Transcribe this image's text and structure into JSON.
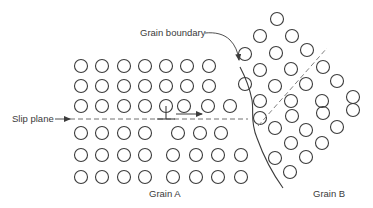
{
  "figure": {
    "type": "crystal-lattice-diagram",
    "labels": {
      "grain_boundary": "Grain boundary",
      "slip_plane": "Slip plane",
      "grain_a": "Grain A",
      "grain_b": "Grain B"
    },
    "colors": {
      "stroke": "#3c3c3c",
      "dashed_line": "#707070",
      "text": "#3a3a3a",
      "background": "#ffffff"
    },
    "atom_radius": 6.5,
    "grain_a": {
      "atoms": [
        [
          81,
          66
        ],
        [
          102,
          66
        ],
        [
          124,
          66
        ],
        [
          145,
          66
        ],
        [
          166,
          66
        ],
        [
          187,
          66
        ],
        [
          209,
          66
        ],
        [
          81,
          86
        ],
        [
          102,
          86
        ],
        [
          124,
          86
        ],
        [
          145,
          86
        ],
        [
          166,
          86
        ],
        [
          187,
          86
        ],
        [
          209,
          86
        ],
        [
          81,
          106
        ],
        [
          102,
          106
        ],
        [
          124,
          106
        ],
        [
          145,
          106
        ],
        [
          166,
          106
        ],
        [
          184,
          106
        ],
        [
          208,
          106
        ],
        [
          230,
          106
        ],
        [
          81,
          133
        ],
        [
          102,
          133
        ],
        [
          124,
          133
        ],
        [
          145,
          133
        ],
        [
          178,
          133
        ],
        [
          200,
          133
        ],
        [
          221,
          133
        ],
        [
          81,
          155
        ],
        [
          102,
          155
        ],
        [
          124,
          155
        ],
        [
          145,
          155
        ],
        [
          173,
          155
        ],
        [
          196,
          155
        ],
        [
          218,
          155
        ],
        [
          241,
          155
        ],
        [
          81,
          177
        ],
        [
          102,
          177
        ],
        [
          124,
          177
        ],
        [
          145,
          177
        ],
        [
          173,
          177
        ],
        [
          196,
          177
        ],
        [
          218,
          177
        ],
        [
          241,
          177
        ]
      ]
    },
    "grain_b": {
      "atoms": [
        [
          277,
          19
        ],
        [
          260,
          36
        ],
        [
          292,
          36
        ],
        [
          245,
          54
        ],
        [
          276,
          53
        ],
        [
          307,
          50
        ],
        [
          260,
          70
        ],
        [
          291,
          69
        ],
        [
          323,
          67
        ],
        [
          245,
          84
        ],
        [
          275,
          86
        ],
        [
          306,
          84
        ],
        [
          337,
          81
        ],
        [
          260,
          101
        ],
        [
          291,
          101
        ],
        [
          322,
          101
        ],
        [
          353,
          97
        ],
        [
          260,
          118
        ],
        [
          292,
          116
        ],
        [
          323,
          113
        ],
        [
          353,
          110
        ],
        [
          275,
          128
        ],
        [
          306,
          130
        ],
        [
          337,
          127
        ],
        [
          291,
          143
        ],
        [
          322,
          143
        ],
        [
          275,
          158
        ],
        [
          306,
          157
        ],
        [
          290,
          172
        ]
      ]
    },
    "slip_plane_line": {
      "x1": 70,
      "y1": 119,
      "x2": 248,
      "y2": 119
    },
    "grain_b_slip_line": {
      "x1": 258,
      "y1": 126,
      "x2": 327,
      "y2": 48
    },
    "dislocation": {
      "x": 166,
      "y": 119,
      "stem_top": 106,
      "bar_half": 9
    },
    "motion_arrow": {
      "x1": 176,
      "y1": 114,
      "x2": 202,
      "y2": 114
    },
    "grain_boundary_path": "M 240 67 C 248 82, 250 90, 252 100 C 254 112, 250 122, 257 138 C 262 152, 270 170, 283 188"
  }
}
